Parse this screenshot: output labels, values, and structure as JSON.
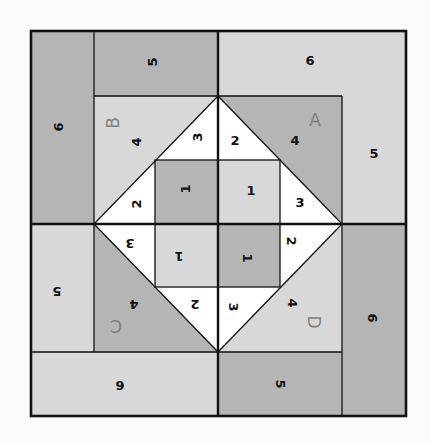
{
  "diagram": {
    "title": "",
    "type": "quilt-block-piecing-diagram",
    "colors": {
      "dark": "#b5b5b5",
      "light": "#d8d8d8",
      "white": "#ffffff",
      "line": "#111111",
      "letter": "#808080",
      "background": "#fbfbfb"
    },
    "quadrants": [
      {
        "id": "A",
        "letter": "A",
        "position": "top-right",
        "rotation": 0,
        "pieces": [
          {
            "label": "1",
            "shade": "light"
          },
          {
            "label": "2",
            "shade": "white"
          },
          {
            "label": "3",
            "shade": "white"
          },
          {
            "label": "4",
            "shade": "dark"
          },
          {
            "label": "5",
            "shade": "light"
          },
          {
            "label": "6",
            "shade": "light"
          }
        ]
      },
      {
        "id": "B",
        "letter": "B",
        "position": "top-left",
        "rotation": -90,
        "pieces": [
          {
            "label": "1",
            "shade": "dark"
          },
          {
            "label": "2",
            "shade": "white"
          },
          {
            "label": "3",
            "shade": "white"
          },
          {
            "label": "4",
            "shade": "light"
          },
          {
            "label": "5",
            "shade": "dark"
          },
          {
            "label": "6",
            "shade": "dark"
          }
        ]
      },
      {
        "id": "C",
        "letter": "C",
        "position": "bottom-left",
        "rotation": 180,
        "pieces": [
          {
            "label": "1",
            "shade": "light"
          },
          {
            "label": "2",
            "shade": "white"
          },
          {
            "label": "3",
            "shade": "white"
          },
          {
            "label": "4",
            "shade": "dark"
          },
          {
            "label": "5",
            "shade": "light"
          },
          {
            "label": "6",
            "shade": "light"
          }
        ]
      },
      {
        "id": "D",
        "letter": "D",
        "position": "bottom-right",
        "rotation": 90,
        "pieces": [
          {
            "label": "1",
            "shade": "dark"
          },
          {
            "label": "2",
            "shade": "white"
          },
          {
            "label": "3",
            "shade": "white"
          },
          {
            "label": "4",
            "shade": "light"
          },
          {
            "label": "5",
            "shade": "dark"
          },
          {
            "label": "6",
            "shade": "dark"
          }
        ]
      }
    ],
    "labels": {
      "A_letter": "A",
      "A_1": "1",
      "A_2": "2",
      "A_3": "3",
      "A_4": "4",
      "A_5": "5",
      "A_6": "6",
      "B_letter": "B",
      "B_1": "1",
      "B_2": "2",
      "B_3": "3",
      "B_4": "4",
      "B_5": "5",
      "B_6": "6",
      "C_letter": "C",
      "C_1": "1",
      "C_2": "2",
      "C_3": "3",
      "C_4": "4",
      "C_5": "5",
      "C_6": "6",
      "D_letter": "D",
      "D_1": "1",
      "D_2": "2",
      "D_3": "3",
      "D_4": "4",
      "D_5": "5",
      "D_6": "6"
    }
  }
}
